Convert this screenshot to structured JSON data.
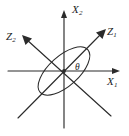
{
  "figure": {
    "type": "coordinate-rotation-diagram",
    "background_color": "#ffffff",
    "stroke_color": "#2b2b2b",
    "text_color": "#1d1d1d"
  },
  "labels": {
    "x_axis": {
      "name": "X",
      "subscript": "1"
    },
    "y_axis": {
      "name": "X",
      "subscript": "2"
    },
    "z1_axis": {
      "name": "Z",
      "subscript": "1"
    },
    "z2_axis": {
      "name": "Z",
      "subscript": "2"
    },
    "angle": "θ"
  },
  "geometry": {
    "origin": {
      "x": 64,
      "y": 71
    },
    "x_axis": {
      "x1": 8,
      "y1": 71,
      "x2": 120,
      "y2": 71,
      "arrow_at": "end"
    },
    "y_axis": {
      "x1": 64,
      "y1": 128,
      "x2": 64,
      "y2": 10,
      "arrow_at": "end"
    },
    "z1_axis": {
      "x1": 18,
      "y1": 118,
      "x2": 106,
      "y2": 29,
      "arrow_at": "end"
    },
    "z2_axis": {
      "x1": 111,
      "y1": 116,
      "x2": 22,
      "y2": 35,
      "arrow_at": "end"
    },
    "ellipse": {
      "cx": 64,
      "cy": 71,
      "rx": 32,
      "ry": 15,
      "rotation_deg": -42
    },
    "rotation_angle_deg": 45
  }
}
